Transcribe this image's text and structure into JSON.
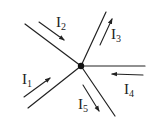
{
  "diagram": {
    "type": "kirchhoff-current-junction",
    "node": {
      "x": 81,
      "y": 66,
      "color": "#111111"
    },
    "wires": [
      {
        "name": "wire-upper-left",
        "x": 25,
        "y": 24
      },
      {
        "name": "wire-upper-right",
        "x": 106,
        "y": 12
      },
      {
        "name": "wire-right",
        "x": 145,
        "y": 66
      },
      {
        "name": "wire-lower-right",
        "x": 115,
        "y": 116
      },
      {
        "name": "wire-lower-left",
        "x": 28,
        "y": 108
      }
    ],
    "currents": [
      {
        "id": "I1",
        "base": "I",
        "sub": "1",
        "direction": "into-node",
        "arrow": {
          "x1": 24,
          "y1": 97,
          "x2": 50,
          "y2": 78
        },
        "label_pos": {
          "x": 22,
          "y": 84
        }
      },
      {
        "id": "I2",
        "base": "I",
        "sub": "2",
        "direction": "into-node",
        "arrow": {
          "x1": 39,
          "y1": 22,
          "x2": 64,
          "y2": 40
        },
        "label_pos": {
          "x": 56,
          "y": 27
        }
      },
      {
        "id": "I3",
        "base": "I",
        "sub": "3",
        "direction": "out-of-node",
        "arrow": {
          "x1": 100,
          "y1": 45,
          "x2": 112,
          "y2": 19
        },
        "label_pos": {
          "x": 111,
          "y": 39
        }
      },
      {
        "id": "I4",
        "base": "I",
        "sub": "4",
        "direction": "into-node",
        "arrow": {
          "x1": 143,
          "y1": 75,
          "x2": 112,
          "y2": 74
        },
        "label_pos": {
          "x": 124,
          "y": 94
        }
      },
      {
        "id": "I5",
        "base": "I",
        "sub": "5",
        "direction": "out-of-node",
        "arrow": {
          "x1": 83,
          "y1": 85,
          "x2": 99,
          "y2": 111
        },
        "label_pos": {
          "x": 78,
          "y": 109
        }
      }
    ],
    "line_color": "#222222"
  },
  "labels": {
    "I1": {
      "base": "I",
      "sub": "1"
    },
    "I2": {
      "base": "I",
      "sub": "2"
    },
    "I3": {
      "base": "I",
      "sub": "3"
    },
    "I4": {
      "base": "I",
      "sub": "4"
    },
    "I5": {
      "base": "I",
      "sub": "5"
    }
  }
}
